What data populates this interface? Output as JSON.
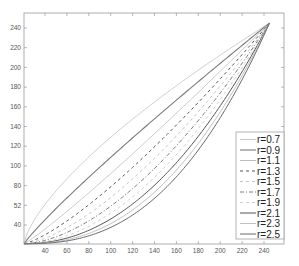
{
  "chart_data": {
    "type": "line",
    "title": "",
    "xlabel": "",
    "ylabel": "",
    "xlim": [
      21,
      258
    ],
    "ylim": [
      21,
      255
    ],
    "grid": false,
    "legend_position": "lower right",
    "x_ticks": [
      "40",
      "60",
      "80",
      "100",
      "120",
      "140",
      "160",
      "180",
      "200",
      "220",
      "240"
    ],
    "y_ticks": [
      "40",
      "52",
      "100",
      "120",
      "140",
      "160",
      "180",
      "200",
      "220",
      "240"
    ],
    "y_tick_positions": [
      40,
      60,
      100,
      120,
      140,
      160,
      180,
      200,
      220,
      240
    ],
    "y_ticks_extra": {
      "80": "80"
    },
    "curve_model": "y = 21 + 224 * ((x - 21) / 224)^r, for x in [21, 245]",
    "series": [
      {
        "name": "r=0.7",
        "r": 0.7,
        "color": "#c8c8c8",
        "dash": "",
        "width": 0.9
      },
      {
        "name": "r=0.9",
        "r": 0.9,
        "color": "#7a7a7a",
        "dash": "",
        "width": 1.1
      },
      {
        "name": "r=1.1",
        "r": 1.1,
        "color": "#bdbdbd",
        "dash": "",
        "width": 0.8
      },
      {
        "name": "r=1.3",
        "r": 1.3,
        "color": "#555555",
        "dash": "3,3",
        "width": 1.0
      },
      {
        "name": "r=1.5",
        "r": 1.5,
        "color": "#c4c4c4",
        "dash": "3,3",
        "width": 1.0
      },
      {
        "name": "r=1.7",
        "r": 1.7,
        "color": "#7a7a7a",
        "dash": "4,2,1,2",
        "width": 1.0
      },
      {
        "name": "r=1.9",
        "r": 1.9,
        "color": "#cfcfcf",
        "dash": "3,3",
        "width": 1.0
      },
      {
        "name": "r=2.1",
        "r": 2.1,
        "color": "#555555",
        "dash": "",
        "width": 1.0
      },
      {
        "name": "r=2.3",
        "r": 2.3,
        "color": "#c0c0c0",
        "dash": "",
        "width": 1.0
      },
      {
        "name": "r=2.5",
        "r": 2.5,
        "color": "#6a6a6a",
        "dash": "",
        "width": 1.0
      }
    ]
  },
  "legend": {
    "entries": [
      "r=0.7",
      "r=0.9",
      "r=1.1",
      "r=1.3",
      "r=1.5",
      "r=1.7",
      "r=1.9",
      "r=2.1",
      "r=2.3",
      "r=2.5"
    ]
  }
}
